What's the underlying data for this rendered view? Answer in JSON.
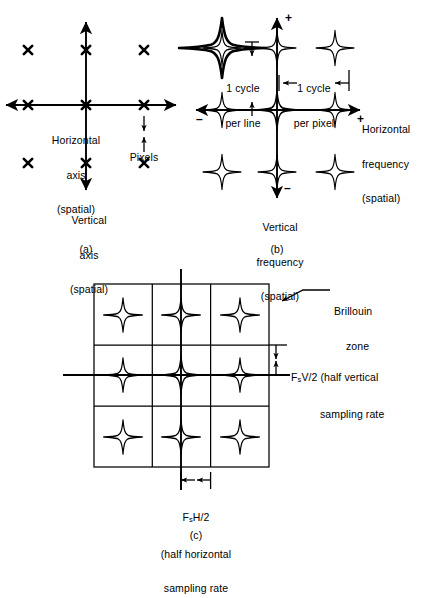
{
  "figure": {
    "ink_color": "#000000",
    "background": "#ffffff"
  },
  "panel_a": {
    "caption": "(a)",
    "horizontal_axis_label_line1": "Horizontal",
    "horizontal_axis_label_line2": "axis",
    "horizontal_axis_label_line3": "(spatial)",
    "vertical_axis_label_line1": "Vertical",
    "vertical_axis_label_line2": "axis",
    "vertical_axis_label_line3": "(spatial)",
    "pixels_label": "Pixels",
    "sample_marker": "x",
    "sample_count": 9
  },
  "panel_b": {
    "caption": "(b)",
    "horizontal_axis_label_line1": "Horizontal",
    "horizontal_axis_label_line2": "frequency",
    "horizontal_axis_label_line3": "(spatial)",
    "vertical_axis_label_line1": "Vertical",
    "vertical_axis_label_line2": "frequency",
    "vertical_axis_label_line3": "(spatial)",
    "plus_right": "+",
    "plus_top": "+",
    "minus_left": "–",
    "minus_bottom": "–",
    "cycle_per_line_line1": "1 cycle",
    "cycle_per_line_line2": "per line",
    "cycle_per_pixel_line1": "1 cycle",
    "cycle_per_pixel_line2": "per pixel",
    "repeat_spectra_count": 9
  },
  "panel_c": {
    "caption": "(c)",
    "brillouin_label_line1": "Brillouin",
    "brillouin_label_line2": "zone",
    "vertical_measure_symbol_pre": "F",
    "vertical_measure_symbol_sub": "s",
    "vertical_measure_symbol_post": "V/2 (half vertical",
    "vertical_measure_line2": "sampling rate",
    "horizontal_measure_symbol_pre": "F",
    "horizontal_measure_symbol_sub": "s",
    "horizontal_measure_symbol_post": "H/2",
    "horizontal_measure_line2": "(half horizontal",
    "horizontal_measure_line3": "sampling rate",
    "grid_rows": 3,
    "grid_cols": 3,
    "repeat_spectra_count": 9
  }
}
